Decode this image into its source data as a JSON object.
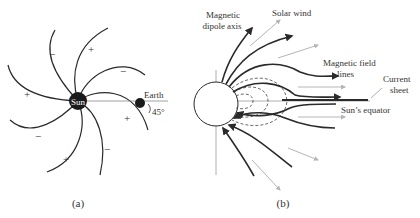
{
  "panel_a": {
    "caption": "(a)",
    "sun_label": "Sun",
    "earth_label": "Earth",
    "angle_label": "45°",
    "sector_signs": [
      "+",
      "−",
      "+",
      "−",
      "+",
      "−",
      "+",
      "−"
    ]
  },
  "panel_b": {
    "caption": "(b)",
    "labels": {
      "dipole_axis": [
        "Magnetic",
        "dipole axis"
      ],
      "solar_wind": "Solar wind",
      "field_lines": [
        "Magnetic field",
        "lines"
      ],
      "current_sheet": [
        "Current",
        "sheet"
      ],
      "equator": "Sun’s equator"
    }
  },
  "colors": {
    "line": "#2a2a2a",
    "wind_arrow": "#b5b5b5",
    "dashed": "#444444"
  }
}
